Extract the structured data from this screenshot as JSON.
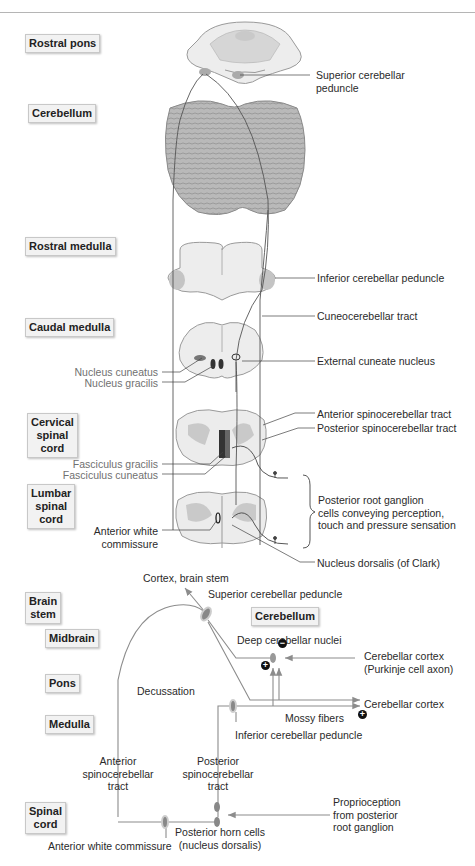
{
  "upper_section": {
    "level_tags": [
      {
        "id": "rostral-pons",
        "label": "Rostral pons"
      },
      {
        "id": "cerebellum",
        "label": "Cerebellum"
      },
      {
        "id": "rostral-medulla",
        "label": "Rostral medulla"
      },
      {
        "id": "caudal-medulla",
        "label": "Caudal medulla"
      },
      {
        "id": "cervical-spinal-cord",
        "label": "Cervical\nspinal\ncord"
      },
      {
        "id": "lumbar-spinal-cord",
        "label": "Lumbar\nspinal\ncord"
      }
    ],
    "right_labels": {
      "superior_cerebellar_peduncle": "Superior cerebellar\npeduncle",
      "inferior_cerebellar_peduncle": "Inferior cerebellar peduncle",
      "cuneocerebellar_tract": "Cuneocerebellar tract",
      "external_cuneate_nucleus": "External cuneate nucleus",
      "anterior_spinocerebellar_tract": "Anterior spinocerebellar tract",
      "posterior_spinocerebellar_tract": "Posterior spinocerebellar tract",
      "posterior_root_ganglion": "Posterior root ganglion\ncells conveying perception,\ntouch and pressure sensation",
      "nucleus_dorsalis": "Nucleus dorsalis (of Clark)"
    },
    "left_labels": {
      "nucleus_cuneatus": "Nucleus cuneatus",
      "nucleus_gracilis": "Nucleus gracilis",
      "fasciculus_gracilis": "Fasciculus gracilis",
      "fasciculus_cuneatus": "Fasciculus cuneatus",
      "anterior_white_commissure": "Anterior white\ncommissure"
    }
  },
  "schematic": {
    "level_tags": {
      "brain_stem": "Brain\nstem",
      "midbrain": "Midbrain",
      "pons": "Pons",
      "medulla": "Medulla",
      "spinal_cord": "Spinal\ncord",
      "cerebellum": "Cerebellum"
    },
    "labels": {
      "cortex_brain_stem": "Cortex, brain stem",
      "superior_cerebellar_peduncle": "Superior cerebellar peduncle",
      "deep_cerebellar_nuclei": "Deep cerebellar nuclei",
      "purkinje": "Cerebellar cortex\n(Purkinje cell axon)",
      "decussation": "Decussation",
      "cerebellar_cortex": "Cerebellar cortex",
      "mossy_fibers": "Mossy fibers",
      "inferior_cerebellar_peduncle": "Inferior cerebellar peduncle",
      "anterior_spinocerebellar_tract": "Anterior\nspinocerebellar\ntract",
      "posterior_spinocerebellar_tract": "Posterior\nspinocerebellar\ntract",
      "proprioception": "Proprioception\nfrom posterior\nroot ganglion",
      "posterior_horn_cells": "Posterior horn cells\n(nucleus dorsalis)",
      "anterior_white_commissure": "Anterior white commissure"
    },
    "signs": {
      "inhibitory": "−",
      "excitatory_deep": "+",
      "excitatory_cortex": "+"
    }
  },
  "colors": {
    "tissue_fill": "#ececec",
    "tissue_stroke": "#9a9a9a",
    "gray_matter": "#c9c9c9",
    "cerebellum_fill": "#b8b8b8",
    "tract_line": "#555555",
    "schematic_line": "#8c8c8c",
    "nucleus_dark": "#333333"
  }
}
